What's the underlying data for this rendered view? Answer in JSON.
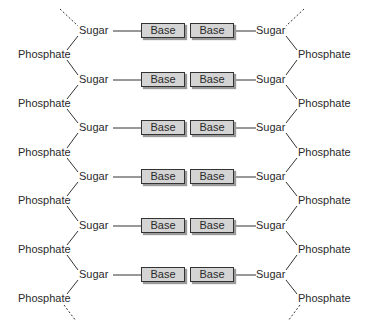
{
  "diagram": {
    "type": "DNA double helix (ladder schematic)",
    "labels": {
      "sugar": "Sugar",
      "base": "Base",
      "phosphate": "Phosphate"
    },
    "rows": [
      {
        "sugar_y": 31
      },
      {
        "sugar_y": 80
      },
      {
        "sugar_y": 128
      },
      {
        "sugar_y": 177
      },
      {
        "sugar_y": 226
      },
      {
        "sugar_y": 275
      }
    ],
    "phosphate_y": [
      55,
      104,
      153,
      201,
      250,
      299
    ],
    "colors": {
      "line": "#333333",
      "base_fill": "#d4d4d4",
      "text": "#2a2a2a"
    }
  }
}
